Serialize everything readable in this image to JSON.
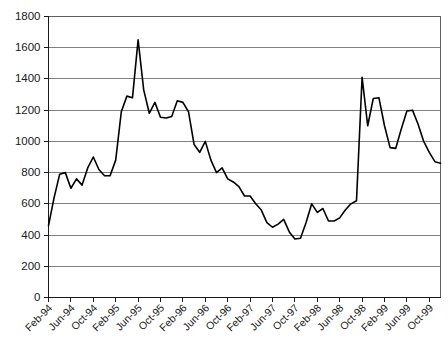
{
  "chart_data": {
    "type": "line",
    "title": "",
    "subtitle": "",
    "xlabel": "",
    "ylabel": "",
    "ylim": [
      0,
      1800
    ],
    "ytick_step": 200,
    "ytick_labels": [
      "0",
      "200",
      "400",
      "600",
      "800",
      "1000",
      "1200",
      "1400",
      "1600",
      "1800"
    ],
    "ytick_values": [
      0,
      200,
      400,
      600,
      800,
      1000,
      1200,
      1400,
      1600,
      1800
    ],
    "grid": true,
    "grid_axis": "y",
    "legend": false,
    "legend_position": "none",
    "line_color": "#000000",
    "grid_color": "#808080",
    "axis_color": "#1a1a1a",
    "background_color": "#ffffff",
    "xtick_labels": [
      "Feb-94",
      "Jun-94",
      "Oct-94",
      "Feb-95",
      "Jun-95",
      "Oct-95",
      "Feb-96",
      "Jun-96",
      "Oct-96",
      "Feb-97",
      "Jun-97",
      "Oct-97",
      "Feb-98",
      "Jun-98",
      "Oct-98",
      "Feb-99",
      "Jun-99",
      "Oct-99"
    ],
    "xtick_label_interval": 4,
    "xtick_label_rotation": -45,
    "x": [
      "Feb-94",
      "Mar-94",
      "Apr-94",
      "May-94",
      "Jun-94",
      "Jul-94",
      "Aug-94",
      "Sep-94",
      "Oct-94",
      "Nov-94",
      "Dec-94",
      "Jan-95",
      "Feb-95",
      "Mar-95",
      "Apr-95",
      "May-95",
      "Jun-95",
      "Jul-95",
      "Aug-95",
      "Sep-95",
      "Oct-95",
      "Nov-95",
      "Dec-95",
      "Jan-96",
      "Feb-96",
      "Mar-96",
      "Apr-96",
      "May-96",
      "Jun-96",
      "Jul-96",
      "Aug-96",
      "Sep-96",
      "Oct-96",
      "Nov-96",
      "Dec-96",
      "Jan-97",
      "Feb-97",
      "Mar-97",
      "Apr-97",
      "May-97",
      "Jun-97",
      "Jul-97",
      "Aug-97",
      "Sep-97",
      "Oct-97",
      "Nov-97",
      "Dec-97",
      "Jan-98",
      "Feb-98",
      "Mar-98",
      "Apr-98",
      "May-98",
      "Jun-98",
      "Jul-98",
      "Aug-98",
      "Sep-98",
      "Oct-98",
      "Nov-98",
      "Dec-98",
      "Jan-99",
      "Feb-99",
      "Mar-99",
      "Apr-99",
      "May-99",
      "Jun-99",
      "Jul-99",
      "Aug-99",
      "Sep-99",
      "Oct-99",
      "Nov-99",
      "Dec-99"
    ],
    "values": [
      460,
      640,
      790,
      800,
      700,
      760,
      720,
      830,
      900,
      820,
      780,
      780,
      880,
      1190,
      1290,
      1280,
      1650,
      1330,
      1180,
      1250,
      1155,
      1150,
      1160,
      1260,
      1250,
      1190,
      980,
      930,
      1000,
      880,
      800,
      830,
      760,
      740,
      710,
      650,
      650,
      600,
      560,
      480,
      450,
      470,
      500,
      420,
      375,
      380,
      480,
      600,
      545,
      570,
      490,
      490,
      510,
      560,
      600,
      620,
      1410,
      1100,
      1275,
      1280,
      1100,
      960,
      955,
      1080,
      1195,
      1200,
      1110,
      1000,
      930,
      870,
      860
    ]
  }
}
